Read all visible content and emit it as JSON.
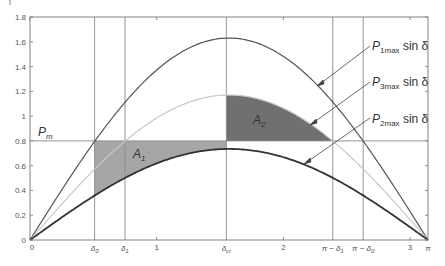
{
  "chart_data": {
    "type": "line",
    "title": "",
    "xlabel": "",
    "ylabel": "",
    "xlim": [
      0,
      3.1416
    ],
    "ylim": [
      0,
      1.8
    ],
    "grid": false,
    "y_ticks": [
      "0",
      "0.2",
      "0.4",
      "0.6",
      "0.8",
      "1",
      "1.2",
      "1.4",
      "1.6",
      "1.8"
    ],
    "y_tick_values": [
      0,
      0.2,
      0.4,
      0.6,
      0.8,
      1.0,
      1.2,
      1.4,
      1.6,
      1.8
    ],
    "x_ticks": [
      "0",
      "1",
      "2",
      "3"
    ],
    "x_tick_values": [
      0,
      1,
      2,
      3
    ],
    "x_special_labels": [
      {
        "label": "δ0",
        "x": 0.51
      },
      {
        "label": "δ1",
        "x": 0.75
      },
      {
        "label": "δcr",
        "x": 1.55
      },
      {
        "label": "π − δ1",
        "x": 2.39
      },
      {
        "label": "π − δ0",
        "x": 2.63
      },
      {
        "label": "π",
        "x": 3.1416
      }
    ],
    "series": [
      {
        "name": "P1max sin δ",
        "amplitude": 1.63,
        "color": "#555555",
        "width": 1.2
      },
      {
        "name": "P3max sin δ",
        "amplitude": 1.17,
        "color": "#c8c8c8",
        "width": 1.2
      },
      {
        "name": "P2max sin δ",
        "amplitude": 0.735,
        "color": "#333333",
        "width": 1.8
      }
    ],
    "horizontal_lines": [
      {
        "label": "Pm",
        "y": 0.8
      }
    ],
    "vertical_lines": [
      0.51,
      0.75,
      1.55,
      2.39,
      2.63
    ],
    "areas": [
      {
        "label": "A1",
        "from": 0.51,
        "to": 1.55,
        "between": [
          "P2max sin δ",
          "Pm"
        ],
        "color": "#a6a6a6"
      },
      {
        "label": "A2",
        "from": 1.55,
        "to": 2.39,
        "between": [
          "Pm",
          "P3max sin δ"
        ],
        "color": "#707070"
      }
    ],
    "annotations": [
      "P1max sin δ",
      "P3max sin δ",
      "P2max sin δ",
      "Pm",
      "A1",
      "A2"
    ]
  },
  "labels": {
    "pm": "P",
    "pm_sub": "m",
    "a1": "A",
    "a1_sub": "1",
    "a2": "A",
    "a2_sub": "2",
    "p1": "P",
    "p1_sub": "1max",
    "p3": "P",
    "p3_sub": "3max",
    "p2": "P",
    "p2_sub": "2max",
    "sin_delta": " sin δ"
  }
}
